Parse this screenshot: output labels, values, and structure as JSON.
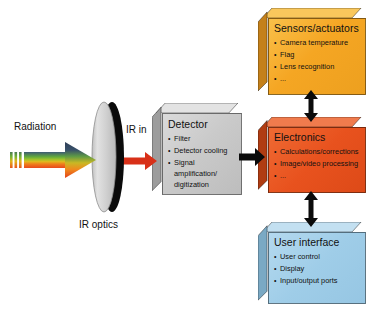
{
  "diagram": {
    "labels": {
      "radiation": "Radiation",
      "ir_in": "IR in",
      "ir_optics": "IR optics"
    },
    "boxes": [
      {
        "id": "sensors-actuators",
        "title": "Sensors/actuators",
        "items": [
          "Camera temperature",
          "Flag",
          "Lens recognition",
          "..."
        ],
        "color_front": "#f6a823",
        "color_top": "#f9c75c",
        "color_left": "#c4801a"
      },
      {
        "id": "detector",
        "title": "Detector",
        "items": [
          "Filter",
          "Detector cooling",
          "Signal amplification/ digitization"
        ],
        "color_front": "#c9c9c9",
        "color_top": "#e3e3e3",
        "color_left": "#9d9d9d"
      },
      {
        "id": "electronics",
        "title": "Electronics",
        "items": [
          "Calculations/corrections",
          "Image/video processing",
          "..."
        ],
        "color_front": "#e8521e",
        "color_top": "#f07b4d",
        "color_left": "#b03c12"
      },
      {
        "id": "user-interface",
        "title": "User interface",
        "items": [
          "User control",
          "Display",
          "Input/output ports"
        ],
        "color_front": "#9fcde8",
        "color_top": "#c3e0f1",
        "color_left": "#7aa9c4"
      }
    ],
    "arrows": {
      "radiation_arrow": "spectral-arrow-right",
      "ir_in_arrow": "red-arrow-right",
      "detector_to_electronics": "black-arrow-right",
      "sensors_to_electronics": "black-double-arrow-vertical",
      "electronics_to_ui": "black-double-arrow-vertical"
    },
    "colors": {
      "red_arrow": "#d83018",
      "black_arrow": "#0b0b0b",
      "lens_body": "#d6d6d6",
      "lens_edge": "#0a0a0a"
    }
  }
}
